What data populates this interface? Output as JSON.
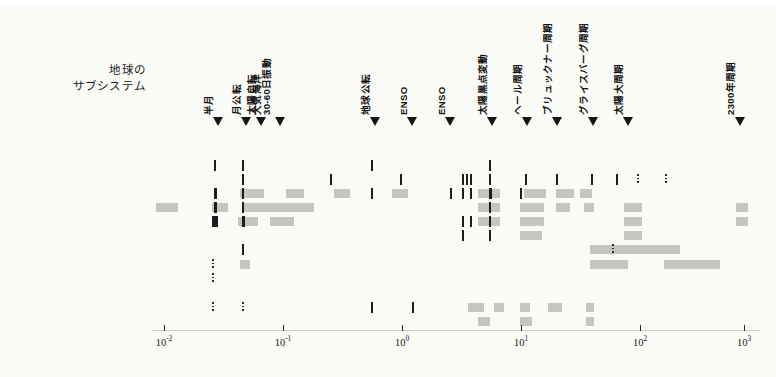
{
  "figure": {
    "subsystem_title_line1": "地球の",
    "subsystem_title_line2": "サブシステム",
    "background_color": "#fbfbf8",
    "mark_color": "#c6c6c0",
    "dark_mark_color": "#1d1d1d"
  },
  "chart_data": {
    "type": "heatmap",
    "xlabel": "",
    "ylabel": "",
    "xscale": "log",
    "xlim": [
      0.005,
      3000
    ],
    "grid": false,
    "legend": "none",
    "x_tick_labels": [
      "10-2",
      "10-1",
      "100",
      "101",
      "102",
      "103"
    ],
    "x_tick_values": [
      0.01,
      0.1,
      1,
      10,
      100,
      1000
    ],
    "x_tick_exponents": [
      "-2",
      "-1",
      "0",
      "1",
      "2",
      "3"
    ],
    "categories": [
      "銀河",
      "ミランコビッチ",
      "地球月回転",
      "太陽",
      "Lod, PM",
      "気候 (大気)",
      "気候 (海洋)",
      "地球磁場",
      "テクトニズム",
      "火山",
      "地震",
      "堆積物",
      "生物圏"
    ],
    "annotations": [
      {
        "label": "半月",
        "x_px": 218
      },
      {
        "label": "月公転",
        "x_px": 246
      },
      {
        "label": "太陽自転",
        "x_px": 261
      },
      {
        "label": "大気海洋",
        "label2": "30-60日振動",
        "x_px": 280
      },
      {
        "label": "地球公転",
        "x_px": 375
      },
      {
        "label": "ENSO",
        "x_px": 412
      },
      {
        "label": "ENSO",
        "x_px": 450
      },
      {
        "label": "太陽黒点変動",
        "x_px": 492
      },
      {
        "label": "ヘール周期",
        "x_px": 527
      },
      {
        "label": "ブリュックナー周期",
        "x_px": 557
      },
      {
        "label": "グライスバーグ周期",
        "x_px": 593
      },
      {
        "label": "太陽大周期",
        "x_px": 628
      },
      {
        "label": "2300年周期",
        "x_px": 740
      }
    ],
    "rows": [
      {
        "name": "銀河",
        "marks": []
      },
      {
        "name": "ミランコビッチ",
        "marks": []
      },
      {
        "name": "地球月回転",
        "marks": [
          {
            "x": 214,
            "w": 2,
            "style": "dark"
          },
          {
            "x": 242,
            "w": 2,
            "style": "dark"
          },
          {
            "x": 371,
            "w": 2,
            "style": "dark"
          },
          {
            "x": 489,
            "w": 2,
            "style": "dark"
          }
        ]
      },
      {
        "name": "太陽",
        "marks": [
          {
            "x": 242,
            "w": 2,
            "style": "dark"
          },
          {
            "x": 330,
            "w": 2,
            "style": "dark"
          },
          {
            "x": 400,
            "w": 2,
            "style": "dark"
          },
          {
            "x": 462,
            "w": 2,
            "style": "dark"
          },
          {
            "x": 466,
            "w": 2,
            "style": "dark"
          },
          {
            "x": 470,
            "w": 2,
            "style": "dark"
          },
          {
            "x": 489,
            "w": 2,
            "style": "dark"
          },
          {
            "x": 525,
            "w": 2,
            "style": "dark"
          },
          {
            "x": 556,
            "w": 2,
            "style": "dark"
          },
          {
            "x": 591,
            "w": 2,
            "style": "dark"
          },
          {
            "x": 616,
            "w": 2,
            "style": "dark"
          },
          {
            "x": 637,
            "w": 2,
            "style": "dotted"
          },
          {
            "x": 665,
            "w": 2,
            "style": "dotted"
          }
        ]
      },
      {
        "name": "Lod, PM",
        "marks": [
          {
            "x": 214,
            "w": 3,
            "style": "dark"
          },
          {
            "x": 240,
            "w": 24,
            "style": "grey"
          },
          {
            "x": 242,
            "w": 2,
            "style": "dark"
          },
          {
            "x": 286,
            "w": 18,
            "style": "grey"
          },
          {
            "x": 334,
            "w": 16,
            "style": "grey"
          },
          {
            "x": 371,
            "w": 2,
            "style": "dark"
          },
          {
            "x": 392,
            "w": 16,
            "style": "grey"
          },
          {
            "x": 450,
            "w": 2,
            "style": "dark"
          },
          {
            "x": 462,
            "w": 2,
            "style": "dark"
          },
          {
            "x": 470,
            "w": 2,
            "style": "dark"
          },
          {
            "x": 478,
            "w": 22,
            "style": "grey"
          },
          {
            "x": 489,
            "w": 3,
            "style": "dark"
          },
          {
            "x": 520,
            "w": 2,
            "style": "dark"
          },
          {
            "x": 524,
            "w": 22,
            "style": "grey"
          },
          {
            "x": 556,
            "w": 18,
            "style": "grey"
          },
          {
            "x": 580,
            "w": 12,
            "style": "grey"
          }
        ]
      },
      {
        "name": "気候 (大気)",
        "marks": [
          {
            "x": 156,
            "w": 22,
            "style": "grey"
          },
          {
            "x": 212,
            "w": 16,
            "style": "grey"
          },
          {
            "x": 214,
            "w": 3,
            "style": "dark"
          },
          {
            "x": 242,
            "w": 2,
            "style": "dark"
          },
          {
            "x": 244,
            "w": 70,
            "style": "grey"
          },
          {
            "x": 478,
            "w": 22,
            "style": "grey"
          },
          {
            "x": 489,
            "w": 2,
            "style": "dark"
          },
          {
            "x": 520,
            "w": 24,
            "style": "grey"
          },
          {
            "x": 556,
            "w": 14,
            "style": "grey"
          },
          {
            "x": 584,
            "w": 10,
            "style": "grey"
          },
          {
            "x": 624,
            "w": 18,
            "style": "grey"
          },
          {
            "x": 736,
            "w": 12,
            "style": "grey"
          }
        ]
      },
      {
        "name": "気候 (海洋)",
        "marks": [
          {
            "x": 212,
            "w": 6,
            "style": "dark"
          },
          {
            "x": 238,
            "w": 20,
            "style": "grey"
          },
          {
            "x": 242,
            "w": 3,
            "style": "dark"
          },
          {
            "x": 270,
            "w": 24,
            "style": "grey"
          },
          {
            "x": 462,
            "w": 2,
            "style": "dark"
          },
          {
            "x": 470,
            "w": 2,
            "style": "dark"
          },
          {
            "x": 478,
            "w": 22,
            "style": "grey"
          },
          {
            "x": 489,
            "w": 2,
            "style": "dark"
          },
          {
            "x": 520,
            "w": 24,
            "style": "grey"
          },
          {
            "x": 624,
            "w": 18,
            "style": "grey"
          },
          {
            "x": 736,
            "w": 12,
            "style": "grey"
          }
        ]
      },
      {
        "name": "地球磁場",
        "marks": [
          {
            "x": 462,
            "w": 2,
            "style": "dark"
          },
          {
            "x": 489,
            "w": 2,
            "style": "dark"
          },
          {
            "x": 520,
            "w": 22,
            "style": "grey"
          },
          {
            "x": 624,
            "w": 18,
            "style": "grey"
          }
        ]
      },
      {
        "name": "テクトニズム",
        "marks": [
          {
            "x": 242,
            "w": 2,
            "style": "dark"
          },
          {
            "x": 590,
            "w": 90,
            "style": "grey"
          },
          {
            "x": 612,
            "w": 2,
            "style": "dotted"
          }
        ]
      },
      {
        "name": "火山",
        "marks": [
          {
            "x": 212,
            "w": 2,
            "style": "dotted"
          },
          {
            "x": 240,
            "w": 10,
            "style": "grey"
          },
          {
            "x": 590,
            "w": 38,
            "style": "grey"
          },
          {
            "x": 664,
            "w": 56,
            "style": "grey"
          }
        ]
      },
      {
        "name": "地震",
        "marks": [
          {
            "x": 212,
            "w": 2,
            "style": "dotted"
          }
        ]
      },
      {
        "name": "堆積物",
        "marks": [
          {
            "x": 212,
            "w": 2,
            "style": "dotted"
          },
          {
            "x": 242,
            "w": 2,
            "style": "dotted"
          },
          {
            "x": 371,
            "w": 2,
            "style": "dark"
          },
          {
            "x": 412,
            "w": 2,
            "style": "dark"
          },
          {
            "x": 468,
            "w": 16,
            "style": "grey"
          },
          {
            "x": 494,
            "w": 10,
            "style": "grey"
          },
          {
            "x": 520,
            "w": 10,
            "style": "grey"
          },
          {
            "x": 548,
            "w": 14,
            "style": "grey"
          },
          {
            "x": 586,
            "w": 8,
            "style": "grey"
          }
        ]
      },
      {
        "name": "生物圏",
        "marks": [
          {
            "x": 478,
            "w": 12,
            "style": "grey"
          },
          {
            "x": 520,
            "w": 12,
            "style": "grey"
          },
          {
            "x": 586,
            "w": 8,
            "style": "grey"
          }
        ]
      }
    ]
  }
}
